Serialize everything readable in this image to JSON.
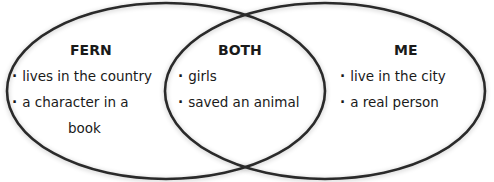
{
  "diagram": {
    "type": "venn",
    "colors": {
      "stroke": "#2a2a2a",
      "fill": "#ffffff",
      "text": "#1a1a1a"
    },
    "sets": [
      {
        "title": "FERN",
        "items": [
          "lives in the country",
          "a character in a",
          "book"
        ]
      },
      {
        "title": "BOTH",
        "items": [
          "girls",
          "saved an animal"
        ]
      },
      {
        "title": "ME",
        "items": [
          "live in the city",
          "a real person"
        ]
      }
    ]
  }
}
